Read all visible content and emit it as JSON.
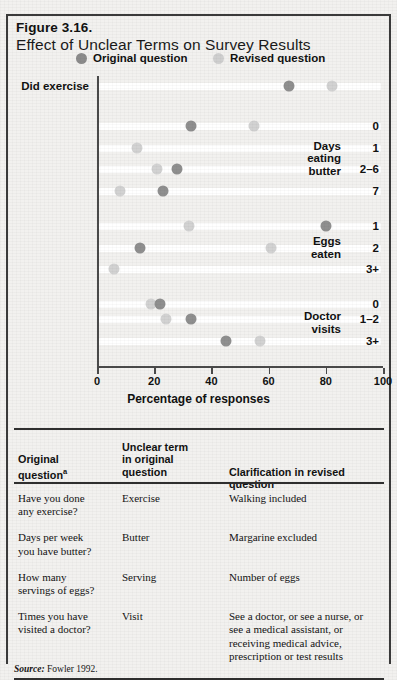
{
  "figure": {
    "number": "Figure 3.16.",
    "title": "Effect of Unclear Terms on Survey Results",
    "source_prefix": "Source:",
    "source_text": "Fowler 1992."
  },
  "legend": {
    "items": [
      {
        "label": "Original question",
        "color": "#8f8f8f",
        "icon": "filled-circle-dark"
      },
      {
        "label": "Revised question",
        "color": "#d2d2d2",
        "icon": "filled-circle-light"
      }
    ]
  },
  "chart_data": {
    "type": "scatter",
    "title": "Effect of Unclear Terms on Survey Results",
    "xlabel": "Percentage of responses",
    "ylabel": "",
    "xlim": [
      0,
      100
    ],
    "xticks": [
      0,
      20,
      40,
      60,
      80,
      100
    ],
    "xticklabels": [
      "0",
      "20",
      "40",
      "60",
      "80",
      "100"
    ],
    "grid": false,
    "legend_position": "top",
    "series": [
      {
        "name": "Original question",
        "color": "#8f8f8f"
      },
      {
        "name": "Revised question",
        "color": "#d2d2d2"
      }
    ],
    "groups": [
      {
        "group": "",
        "rows": [
          {
            "label": "Did exercise",
            "inline_label": true,
            "original": 67,
            "revised": 82
          }
        ]
      },
      {
        "group": "Days eating butter",
        "group_lines": [
          "Days",
          "eating",
          "butter"
        ],
        "rows": [
          {
            "label": "0",
            "original": 33,
            "revised": 55
          },
          {
            "label": "1",
            "original": null,
            "revised": 14
          },
          {
            "label": "2–6",
            "original": 28,
            "revised": 21
          },
          {
            "label": "7",
            "original": 23,
            "revised": 8
          }
        ]
      },
      {
        "group": "Eggs eaten",
        "group_lines": [
          "Eggs",
          "eaten"
        ],
        "rows": [
          {
            "label": "1",
            "original": 80,
            "revised": 32
          },
          {
            "label": "2",
            "original": 15,
            "revised": 61
          },
          {
            "label": "3+",
            "original": null,
            "revised": 6
          }
        ]
      },
      {
        "group": "Doctor visits",
        "group_lines": [
          "Doctor",
          "visits"
        ],
        "rows": [
          {
            "label": "0",
            "original": 22,
            "revised": 19
          },
          {
            "label": "1–2",
            "original": 33,
            "revised": 24
          },
          {
            "label": "3+",
            "original": 45,
            "revised": 57
          }
        ]
      }
    ]
  },
  "table": {
    "headers": [
      {
        "lines": [
          "Original",
          "question"
        ],
        "superscript": "a"
      },
      {
        "lines": [
          "Unclear term",
          "in original",
          "question"
        ],
        "superscript": ""
      },
      {
        "lines": [
          "Clarification in revised question"
        ],
        "superscript": ""
      }
    ],
    "rows": [
      {
        "question_lines": [
          "Have you done",
          "any exercise?"
        ],
        "term": "Exercise",
        "clarification_lines": [
          "Walking included"
        ]
      },
      {
        "question_lines": [
          "Days per week",
          "you have butter?"
        ],
        "term": "Butter",
        "clarification_lines": [
          "Margarine excluded"
        ]
      },
      {
        "question_lines": [
          "How many",
          "servings of eggs?"
        ],
        "term": "Serving",
        "clarification_lines": [
          "Number of eggs"
        ]
      },
      {
        "question_lines": [
          "Times you have",
          "visited a doctor?"
        ],
        "term": "Visit",
        "clarification_lines": [
          "See a doctor, or see a nurse, or",
          "see a medical assistant, or",
          "receiving medical advice,",
          "prescription or test results"
        ]
      }
    ]
  }
}
